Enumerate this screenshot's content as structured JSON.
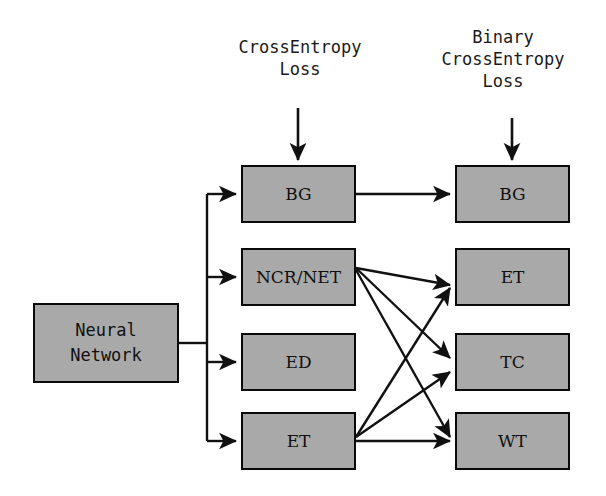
{
  "diagram": {
    "background_color": "#ffffff",
    "box_fill_color": "#a9a9a9",
    "box_border_color": "#0a0a0a",
    "edge_color": "#111111"
  },
  "losses": {
    "left": {
      "name": "cross-entropy-loss",
      "text": "CrossEntropy\nLoss",
      "target": "mid-bg"
    },
    "right": {
      "name": "binary-cross-entropy-loss",
      "text": "Binary\nCrossEntropy\nLoss",
      "target": "out-bg"
    }
  },
  "nodes": {
    "nn": {
      "id": "nn",
      "label": "Neural\nNetwork",
      "column": "input"
    },
    "mid": [
      {
        "id": "mid-bg",
        "label": "BG"
      },
      {
        "id": "mid-ncr",
        "label": "NCR/NET"
      },
      {
        "id": "mid-ed",
        "label": "ED"
      },
      {
        "id": "mid-et",
        "label": "ET"
      }
    ],
    "out": [
      {
        "id": "out-bg",
        "label": "BG"
      },
      {
        "id": "out-et",
        "label": "ET"
      },
      {
        "id": "out-tc",
        "label": "TC"
      },
      {
        "id": "out-wt",
        "label": "WT"
      }
    ]
  },
  "edges": [
    {
      "from": "nn",
      "to": "mid-bg",
      "style": "orthogonal"
    },
    {
      "from": "nn",
      "to": "mid-ncr",
      "style": "orthogonal"
    },
    {
      "from": "nn",
      "to": "mid-ed",
      "style": "orthogonal"
    },
    {
      "from": "nn",
      "to": "mid-et",
      "style": "orthogonal"
    },
    {
      "from": "mid-bg",
      "to": "out-bg",
      "style": "straight"
    },
    {
      "from": "mid-ncr",
      "to": "out-et",
      "style": "straight"
    },
    {
      "from": "mid-ncr",
      "to": "out-tc",
      "style": "straight"
    },
    {
      "from": "mid-ncr",
      "to": "out-wt",
      "style": "straight"
    },
    {
      "from": "mid-et",
      "to": "out-et",
      "style": "straight"
    },
    {
      "from": "mid-et",
      "to": "out-tc",
      "style": "straight"
    },
    {
      "from": "mid-et",
      "to": "out-wt",
      "style": "straight"
    }
  ]
}
